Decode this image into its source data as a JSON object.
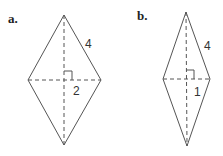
{
  "figures": [
    {
      "label": "a.",
      "side_label": "4",
      "half_diagonal_label": "2"
    },
    {
      "label": "b.",
      "side_label": "4",
      "half_diagonal_label": "1"
    }
  ],
  "colors": {
    "line": "#555555",
    "text": "#222222"
  }
}
